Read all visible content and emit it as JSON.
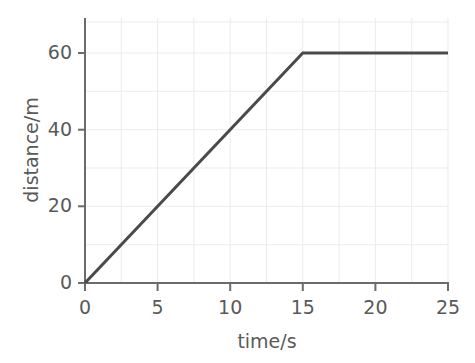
{
  "chart_data": {
    "type": "line",
    "title": "",
    "subtitle": "",
    "xlabel": "time/s",
    "ylabel": "distance/m",
    "xlim": [
      0,
      25
    ],
    "ylim": [
      0,
      69
    ],
    "xticks": [
      0,
      5,
      10,
      15,
      20,
      25
    ],
    "yticks": [
      0,
      20,
      40,
      60
    ],
    "xtick_labels": [
      "0",
      "5",
      "10",
      "15",
      "20",
      "25"
    ],
    "ytick_labels": [
      "0",
      "20",
      "40",
      "60"
    ],
    "grid": true,
    "grid_x_step": 2.5,
    "grid_y_step": 10,
    "legend": null,
    "legend_position": "none",
    "annotations": [],
    "series": [
      {
        "name": "distance",
        "x": [
          0,
          15,
          25
        ],
        "values": [
          0,
          60,
          60
        ]
      }
    ],
    "points": [
      {
        "x": 0,
        "y": 0
      },
      {
        "x": 5,
        "y": 20
      },
      {
        "x": 10,
        "y": 40
      },
      {
        "x": 15,
        "y": 60
      },
      {
        "x": 20,
        "y": 60
      },
      {
        "x": 25,
        "y": 60
      }
    ],
    "colors": {
      "line": "#4a4a4a",
      "axis": "#6b6b6b",
      "grid": "#ebebf0",
      "text": "#5a5a5a",
      "background": "#ffffff"
    }
  }
}
